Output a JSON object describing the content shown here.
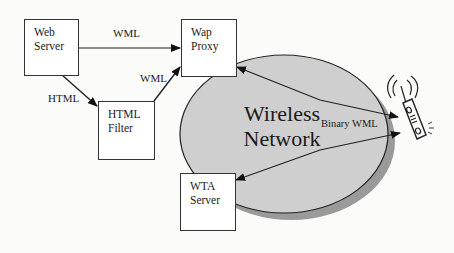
{
  "diagram": {
    "type": "network-architecture",
    "nodes": {
      "web_server": {
        "label": "Web\nServer"
      },
      "wap_proxy": {
        "label": "Wap\nProxy"
      },
      "html_filter": {
        "label": "HTML\nFilter"
      },
      "wta_server": {
        "label": "WTA\nServer"
      },
      "wireless_network": {
        "label": "Wireless\nNetwork"
      },
      "mobile_phone": {
        "label": ""
      }
    },
    "edges": [
      {
        "from": "web_server",
        "to": "wap_proxy",
        "label": "WML",
        "direction": "one-way"
      },
      {
        "from": "web_server",
        "to": "html_filter",
        "label": "HTML",
        "direction": "one-way"
      },
      {
        "from": "html_filter",
        "to": "wap_proxy",
        "label": "WML",
        "direction": "one-way"
      },
      {
        "from": "wap_proxy",
        "to": "mobile_phone",
        "label": "Binary WML",
        "direction": "two-way"
      },
      {
        "from": "wta_server",
        "to": "mobile_phone",
        "label": "Binary WML",
        "direction": "two-way"
      }
    ],
    "edge_labels": {
      "web_to_proxy": "WML",
      "web_to_filter": "HTML",
      "filter_to_proxy": "WML",
      "phone_links": "Binary WML"
    },
    "colors": {
      "network_fill": "#cfcfcf",
      "network_shadow": "#9a9a9a",
      "stroke": "#222222",
      "box_fill": "#ffffff",
      "background": "#fbfbfa"
    }
  }
}
